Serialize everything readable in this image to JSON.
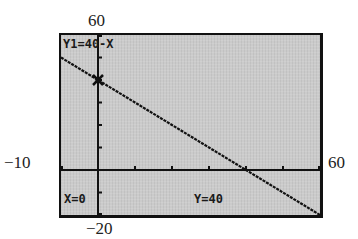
{
  "window": {
    "ymax_label": "60",
    "ymin_label": "−20",
    "xmin_label": "−10",
    "xmax_label": "60"
  },
  "screen": {
    "equation": "Y1=40-X",
    "x_readout": "X=0",
    "y_readout": "Y=40",
    "background_color": "#cbcbcb",
    "ink_color": "#111111"
  },
  "chart_data": {
    "type": "line",
    "title": "Y1=40-X",
    "xlabel": "",
    "ylabel": "",
    "xlim": [
      -10,
      60
    ],
    "ylim": [
      -20,
      60
    ],
    "xscale": 10,
    "yscale": 10,
    "grid": false,
    "series": [
      {
        "name": "Y1=40-X",
        "x": [
          -10,
          0,
          10,
          20,
          30,
          40,
          50,
          60
        ],
        "values": [
          50,
          40,
          30,
          20,
          10,
          0,
          -10,
          -20
        ]
      }
    ],
    "trace_cursor": {
      "x": 0,
      "y": 40
    },
    "x_intercept": 40,
    "y_intercept": 40
  }
}
